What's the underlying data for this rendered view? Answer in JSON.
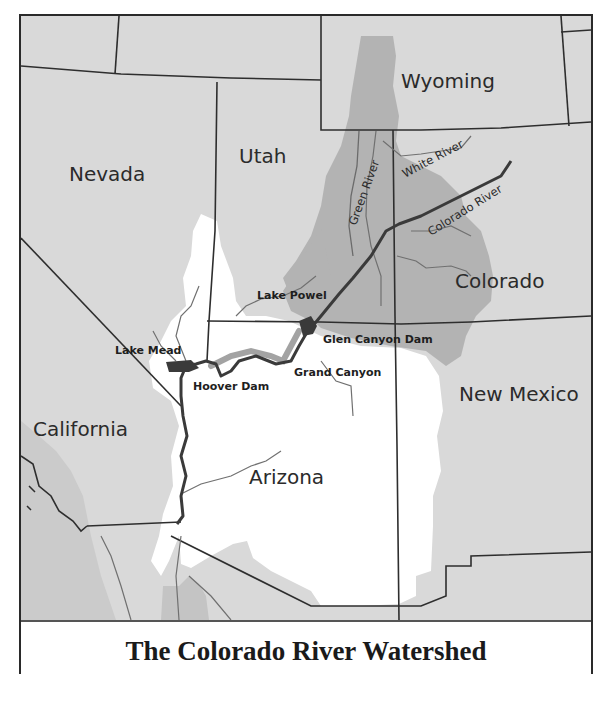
{
  "map": {
    "title": "The Colorado River Watershed",
    "colors": {
      "land": "#d9d9d9",
      "watershed_upper": "#b4b4b4",
      "watershed_lower": "#ffffff",
      "mexico": "#c6c6c6",
      "borders": "#2e2e2e",
      "rivers": "#6b6b6b",
      "main_river": "#262626",
      "lakes": "#3a3a3a"
    },
    "states": [
      {
        "id": "nevada",
        "label": "Nevada"
      },
      {
        "id": "utah",
        "label": "Utah"
      },
      {
        "id": "wyoming",
        "label": "Wyoming"
      },
      {
        "id": "colorado",
        "label": "Colorado"
      },
      {
        "id": "california",
        "label": "California"
      },
      {
        "id": "arizona",
        "label": "Arizona"
      },
      {
        "id": "new-mexico",
        "label": "New Mexico"
      }
    ],
    "rivers": [
      {
        "id": "green-river",
        "label": "Green River"
      },
      {
        "id": "white-river",
        "label": "White River"
      },
      {
        "id": "colorado-river",
        "label": "Colorado River"
      }
    ],
    "features": [
      {
        "id": "lake-powell",
        "label": "Lake Powel"
      },
      {
        "id": "glen-canyon-dam",
        "label": "Glen Canyon Dam"
      },
      {
        "id": "grand-canyon",
        "label": "Grand Canyon"
      },
      {
        "id": "lake-mead",
        "label": "Lake Mead"
      },
      {
        "id": "hoover-dam",
        "label": "Hoover Dam"
      }
    ]
  }
}
